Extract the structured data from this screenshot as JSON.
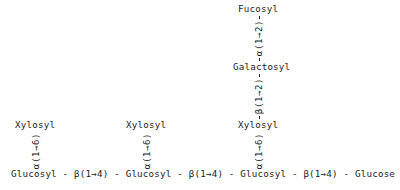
{
  "diagram": {
    "type": "chemical-structure",
    "text_color": "#1c1c1c",
    "background_color": "#ffffff",
    "backbone": {
      "residues": [
        "Glucosyl",
        "Glucosyl",
        "Glucosyl",
        "Glucose"
      ],
      "linkages": [
        "β(1→4)",
        "β(1→4)",
        "β(1→4)"
      ],
      "separator": "-",
      "full_text": "Glucosyl - β(1→4) - Glucosyl - β(1→4) - Glucosyl - β(1→4) - Glucose"
    },
    "branches": [
      {
        "id": "branch-left",
        "residue": "Xylosyl",
        "linkage": "α(1→6)",
        "attached_to": "Glucosyl"
      },
      {
        "id": "branch-middle",
        "residue": "Xylosyl",
        "linkage": "α(1→6)",
        "attached_to": "Glucosyl"
      },
      {
        "id": "branch-right",
        "residue": "Xylosyl",
        "linkage": "α(1→6)",
        "attached_to": "Glucosyl"
      }
    ],
    "right_chain": {
      "galactosyl": "Galactosyl",
      "galactosyl_linkage": "β(1→2)",
      "fucosyl": "Fucosyl",
      "fucosyl_linkage": "α(1→2)"
    }
  }
}
